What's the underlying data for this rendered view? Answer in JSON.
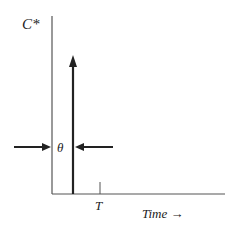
{
  "diagram": {
    "y_axis_label": "C*",
    "x_axis_label": "Time →",
    "tick_label": "T",
    "width_label": "θ",
    "colors": {
      "axis": "#555555",
      "spike": "#222222",
      "arrow": "#222222",
      "text": "#222222"
    },
    "elements": {
      "spike": "impulse-arrow",
      "width_indicator": "inward-pointing-arrows"
    }
  }
}
